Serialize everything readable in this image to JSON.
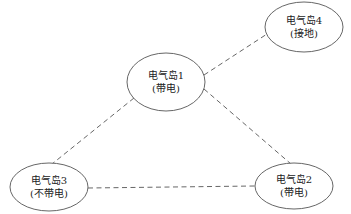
{
  "diagram": {
    "type": "network-topology",
    "colors": {
      "stroke": "#555555",
      "text": "#222222",
      "background": "#ffffff"
    },
    "nodes": [
      {
        "id": "island1",
        "name": "电气岛1",
        "status": "(带电)",
        "cx": 166,
        "cy": 82,
        "rx": 39,
        "ry": 29
      },
      {
        "id": "island2",
        "name": "电气岛2",
        "status": "(带电)",
        "cx": 294,
        "cy": 186,
        "rx": 39,
        "ry": 23
      },
      {
        "id": "island3",
        "name": "电气岛3",
        "status": "(不带电)",
        "cx": 49,
        "cy": 187,
        "rx": 39,
        "ry": 24
      },
      {
        "id": "island4",
        "name": "电气岛4",
        "status": "(接地)",
        "cx": 304,
        "cy": 27,
        "rx": 39,
        "ry": 25
      }
    ],
    "edges": [
      {
        "from": "island1",
        "to": "island4",
        "style": "dashed",
        "x1": 204,
        "y1": 75,
        "x2": 267,
        "y2": 34
      },
      {
        "from": "island1",
        "to": "island2",
        "style": "dashed",
        "x1": 204,
        "y1": 89,
        "x2": 291,
        "y2": 164
      },
      {
        "from": "island1",
        "to": "island3",
        "style": "dashed",
        "x1": 134,
        "y1": 98,
        "x2": 52,
        "y2": 164
      },
      {
        "from": "island3",
        "to": "island2",
        "style": "dashed",
        "x1": 88,
        "y1": 188,
        "x2": 255,
        "y2": 186
      }
    ]
  }
}
